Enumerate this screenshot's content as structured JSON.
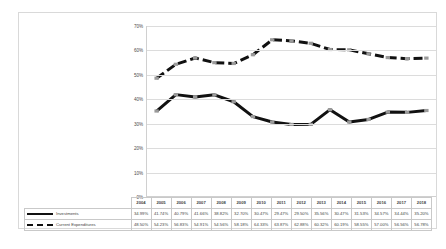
{
  "chart_data": {
    "type": "line",
    "title": "",
    "subtitle": "",
    "xlabel": "",
    "ylabel": "",
    "ylim": [
      0,
      70
    ],
    "yticks": [
      "0%",
      "10%",
      "20%",
      "30%",
      "40%",
      "50%",
      "60%",
      "70%"
    ],
    "ytick_values": [
      0,
      10,
      20,
      30,
      40,
      50,
      60,
      70
    ],
    "grid": true,
    "legend_position": "bottom-table",
    "categories": [
      "2004",
      "2005",
      "2006",
      "2007",
      "2008",
      "2009",
      "2010",
      "2011",
      "2012",
      "2013",
      "2014",
      "2015",
      "2016",
      "2017",
      "2018"
    ],
    "series": [
      {
        "name": "Investments",
        "style": "solid",
        "color": "#111111",
        "values": [
          34.99,
          41.74,
          40.79,
          41.66,
          38.82,
          32.7,
          30.47,
          29.47,
          29.5,
          35.56,
          30.47,
          31.53,
          34.57,
          34.44,
          35.2
        ],
        "labels": [
          "34.99%",
          "41.74%",
          "40.79%",
          "41.66%",
          "38.82%",
          "32.70%",
          "30.47%",
          "29.47%",
          "29.50%",
          "35.56%",
          "30.47%",
          "31.53%",
          "34.57%",
          "34.44%",
          "35.20%"
        ]
      },
      {
        "name": "Current Expenditures",
        "style": "dashed",
        "color": "#111111",
        "values": [
          48.5,
          54.23,
          56.83,
          54.91,
          54.56,
          58.18,
          64.33,
          63.87,
          62.88,
          60.32,
          60.19,
          58.55,
          57.0,
          56.56,
          56.78
        ],
        "labels": [
          "48.50%",
          "54.23%",
          "56.83%",
          "54.91%",
          "54.56%",
          "58.18%",
          "64.33%",
          "63.87%",
          "62.88%",
          "60.32%",
          "60.19%",
          "58.55%",
          "57.00%",
          "56.56%",
          "56.78%"
        ]
      }
    ]
  }
}
